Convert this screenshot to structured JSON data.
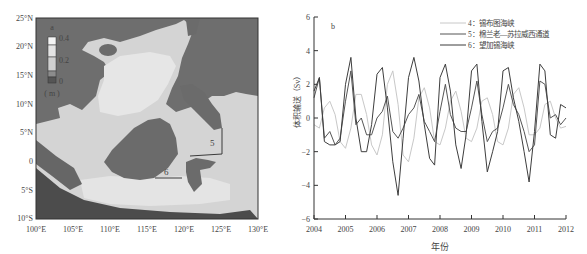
{
  "panel_a": {
    "label": "a",
    "colorbar": {
      "ticks": [
        "0.4",
        "0.2",
        "0"
      ],
      "unit": "( m )"
    },
    "lat_ticks": [
      "25°N",
      "20°N",
      "15°N",
      "10°N",
      "5°N",
      "0",
      "5°S",
      "10°S"
    ],
    "lon_ticks": [
      "100°E",
      "105°E",
      "110°E",
      "115°E",
      "120°E",
      "125°E",
      "130°E"
    ],
    "section_labels": [
      "5",
      "6"
    ],
    "colors": {
      "land": "#6b6b6b",
      "deep": "#4f4f4f",
      "shallow": "#c9c9c9",
      "mid": "#dcdcdc",
      "high": "#eeeeee"
    }
  },
  "chart_data": {
    "type": "line",
    "panel_label": "b",
    "title": "",
    "xlabel": "年份",
    "ylabel": "体积输送（Sv）",
    "xlim": [
      2004,
      2012
    ],
    "ylim": [
      -6,
      6
    ],
    "x_ticks": [
      "2004",
      "2005",
      "2006",
      "2007",
      "2008",
      "2009",
      "2010",
      "2011",
      "2012"
    ],
    "y_ticks": [
      "6",
      "4",
      "2",
      "0",
      "-2",
      "-4",
      "-6"
    ],
    "grid": false,
    "legend_position": "upper right",
    "x": [
      2004.0,
      2004.17,
      2004.33,
      2004.5,
      2004.67,
      2004.83,
      2005.0,
      2005.17,
      2005.33,
      2005.5,
      2005.67,
      2005.83,
      2006.0,
      2006.17,
      2006.33,
      2006.5,
      2006.67,
      2006.83,
      2007.0,
      2007.17,
      2007.33,
      2007.5,
      2007.67,
      2007.83,
      2008.0,
      2008.17,
      2008.33,
      2008.5,
      2008.67,
      2008.83,
      2009.0,
      2009.17,
      2009.33,
      2009.5,
      2009.67,
      2009.83,
      2010.0,
      2010.17,
      2010.33,
      2010.5,
      2010.67,
      2010.83,
      2011.0,
      2011.17,
      2011.33,
      2011.5,
      2011.67,
      2011.83,
      2012.0
    ],
    "series": [
      {
        "name": "4：锡布图海峡",
        "color": "#c8c8c8",
        "values": [
          -0.4,
          -0.6,
          0.6,
          1.0,
          0.2,
          -1.4,
          -1.8,
          -0.6,
          1.4,
          1.4,
          0.2,
          -1.6,
          -2.2,
          -1.0,
          2.0,
          2.8,
          0.8,
          -2.2,
          -2.6,
          -1.2,
          1.2,
          1.8,
          0.6,
          -1.4,
          -1.6,
          -0.6,
          1.0,
          1.6,
          0.4,
          -1.2,
          -1.4,
          -0.6,
          1.0,
          1.2,
          0.2,
          -1.4,
          -1.6,
          -0.6,
          1.4,
          1.8,
          0.6,
          -1.0,
          -1.0,
          -0.6,
          0.8,
          1.0,
          0.0,
          -0.6,
          -0.5
        ]
      },
      {
        "name": "5：棉兰老—苏拉威西通道",
        "color": "#555555",
        "values": [
          1.2,
          2.4,
          -1.2,
          -0.8,
          -1.6,
          -1.2,
          1.0,
          2.8,
          -0.4,
          0.0,
          -1.0,
          -1.0,
          0.0,
          0.4,
          1.3,
          -0.8,
          -1.2,
          -0.6,
          0.2,
          0.6,
          1.4,
          -0.2,
          -0.8,
          -1.4,
          0.4,
          2.0,
          0.2,
          -0.6,
          -0.8,
          -0.8,
          0.6,
          2.2,
          0.2,
          -1.4,
          -0.8,
          -0.6,
          0.6,
          2.0,
          0.8,
          0.2,
          -0.8,
          -2.0,
          -1.6,
          2.2,
          2.0,
          0.0,
          0.2,
          -0.4,
          0.0
        ]
      },
      {
        "name": "6：望加锡海峡",
        "color": "#3d3d3d",
        "values": [
          1.6,
          2.4,
          -1.4,
          -1.6,
          -1.6,
          -1.4,
          2.0,
          3.6,
          0.0,
          -2.0,
          -2.0,
          -0.4,
          2.6,
          3.0,
          0.6,
          -2.6,
          -4.6,
          -1.2,
          2.4,
          3.6,
          2.2,
          -0.4,
          -2.4,
          -2.8,
          2.4,
          3.2,
          1.6,
          -1.6,
          -3.0,
          -1.0,
          2.8,
          3.2,
          -0.2,
          -3.2,
          -2.0,
          -0.8,
          2.8,
          3.0,
          1.2,
          -0.2,
          -2.0,
          -3.8,
          -0.8,
          3.2,
          2.8,
          -1.0,
          -1.2,
          0.8,
          0.6
        ]
      }
    ]
  }
}
